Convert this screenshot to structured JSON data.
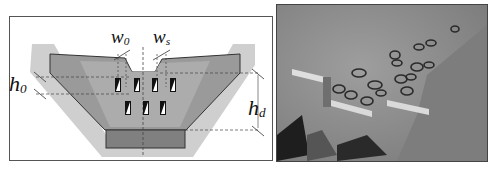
{
  "figure": {
    "left_panel": {
      "type": "dam cross-section schematic",
      "labels": {
        "w0": "w",
        "w0_sub": "0",
        "ws": "w",
        "ws_sub": "s",
        "h0": "h",
        "h0_sub": "0",
        "hd": "h",
        "hd_sub": "d"
      },
      "openings": {
        "top_row": 4,
        "bottom_row": 3
      }
    },
    "right_panel": {
      "type": "grayscale photograph of dam model with debris and slit openings"
    },
    "colors": {
      "outer_band": "#c9c9c9",
      "dam_body": "#8e8e8e",
      "dam_inner": "#a5a5a5",
      "base_block": "#7a7a7a",
      "photo_bg": "#8d8d8d",
      "wall": "#d8d8d8"
    }
  }
}
